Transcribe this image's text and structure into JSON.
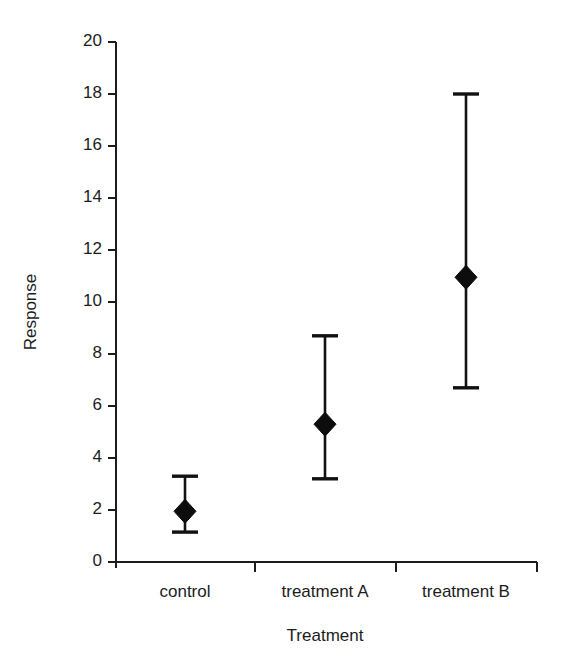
{
  "chart_data": {
    "type": "scatter",
    "title": "",
    "subtitle": "",
    "xlabel": "Treatment",
    "ylabel": "Response",
    "categories": [
      "control",
      "treatment A",
      "treatment B"
    ],
    "values": [
      1.95,
      5.3,
      10.95
    ],
    "error_low": [
      1.15,
      3.2,
      6.7
    ],
    "error_high": [
      3.3,
      8.7,
      18.0
    ],
    "series": [
      {
        "name": "Response",
        "values": [
          1.95,
          5.3,
          10.95
        ],
        "error_low": [
          1.15,
          3.2,
          6.7
        ],
        "error_high": [
          3.3,
          8.7,
          18.0
        ],
        "marker": "diamond",
        "color": "#0d0d0d"
      }
    ],
    "ylim": [
      0,
      20
    ],
    "ytick_values": [
      0,
      2,
      4,
      6,
      8,
      10,
      12,
      14,
      16,
      18,
      20
    ],
    "ytick_labels": [
      "0",
      "2",
      "4",
      "6",
      "8",
      "10",
      "12",
      "14",
      "16",
      "18",
      "20"
    ],
    "grid": false,
    "legend": false,
    "legend_position": "none"
  },
  "axes": {
    "y_label": "Response",
    "x_label": "Treatment",
    "y_ticks": [
      {
        "value": 20,
        "label": "20"
      },
      {
        "value": 18,
        "label": "18"
      },
      {
        "value": 16,
        "label": "16"
      },
      {
        "value": 14,
        "label": "14"
      },
      {
        "value": 12,
        "label": "12"
      },
      {
        "value": 10,
        "label": "10"
      },
      {
        "value": 8,
        "label": "8"
      },
      {
        "value": 6,
        "label": "6"
      },
      {
        "value": 4,
        "label": "4"
      },
      {
        "value": 2,
        "label": "2"
      },
      {
        "value": 0,
        "label": "0"
      }
    ],
    "x_categories": [
      {
        "label": "control"
      },
      {
        "label": "treatment A"
      },
      {
        "label": "treatment B"
      }
    ]
  },
  "style": {
    "marker_color": "#0d0d0d",
    "axis_color": "#1c1c1c",
    "background": "#ffffff"
  }
}
